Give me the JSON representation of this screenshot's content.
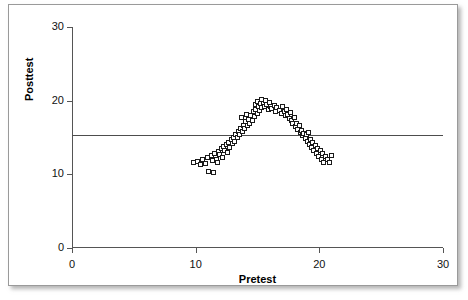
{
  "chart_data": {
    "type": "scatter",
    "title": "",
    "xlabel": "Pretest",
    "ylabel": "Posttest",
    "xlim": [
      0,
      30
    ],
    "ylim": [
      0,
      30
    ],
    "xticks": [
      0,
      10,
      20,
      30
    ],
    "yticks": [
      0,
      10,
      20,
      30
    ],
    "xtick_labels": [
      "0",
      "10",
      "20",
      "30"
    ],
    "ytick_labels": [
      "0",
      "10",
      "20",
      "30"
    ],
    "grid": false,
    "legend": null,
    "marker": "open-square",
    "marker_color": "#1a1a1a",
    "line_color": "#4d4d4d",
    "annotation": "Curvilinear (inverted-U) relation with a flat least-squares regression line at Posttest 15.3, illustrating near-zero linear correlation.",
    "regression_line": {
      "type": "linear-fit",
      "slope": 0.0,
      "intercept": 15.3,
      "x_start": 0,
      "x_end": 30,
      "y_start": 15.3,
      "y_end": 15.3
    },
    "n_points": 106,
    "x": [
      9.9,
      10.2,
      10.4,
      10.6,
      10.8,
      11.0,
      11.1,
      11.3,
      11.4,
      11.5,
      11.6,
      11.7,
      11.8,
      11.9,
      12.0,
      12.1,
      12.2,
      12.3,
      12.4,
      12.5,
      12.6,
      12.7,
      12.8,
      12.9,
      13.0,
      13.1,
      13.2,
      13.3,
      13.4,
      13.5,
      13.6,
      13.7,
      13.75,
      13.8,
      13.9,
      14.0,
      14.1,
      14.15,
      14.2,
      14.3,
      14.4,
      14.5,
      14.6,
      14.7,
      14.8,
      14.85,
      14.9,
      15.0,
      15.05,
      15.1,
      15.2,
      15.3,
      15.35,
      15.4,
      15.5,
      15.6,
      15.7,
      15.8,
      15.9,
      16.0,
      16.1,
      16.2,
      16.4,
      16.5,
      16.6,
      16.8,
      17.0,
      17.1,
      17.2,
      17.3,
      17.4,
      17.5,
      17.6,
      17.7,
      17.8,
      17.9,
      18.0,
      18.1,
      18.2,
      18.3,
      18.4,
      18.5,
      18.6,
      18.7,
      18.8,
      18.9,
      19.0,
      19.1,
      19.2,
      19.25,
      19.3,
      19.4,
      19.5,
      19.6,
      19.7,
      19.8,
      19.9,
      20.0,
      20.1,
      20.2,
      20.3,
      20.4,
      20.5,
      20.7,
      20.9,
      21.0
    ],
    "y": [
      11.6,
      11.7,
      11.2,
      11.9,
      11.4,
      12.2,
      10.3,
      12.5,
      11.8,
      10.2,
      12.8,
      12.0,
      11.5,
      13.0,
      12.6,
      13.4,
      12.2,
      13.7,
      13.1,
      14.0,
      12.9,
      14.3,
      13.6,
      14.6,
      14.1,
      15.0,
      14.4,
      15.4,
      14.9,
      15.8,
      15.3,
      16.2,
      17.6,
      15.7,
      16.6,
      16.1,
      17.1,
      18.0,
      16.5,
      17.4,
      16.9,
      17.9,
      17.3,
      18.4,
      17.8,
      19.4,
      18.8,
      18.2,
      19.8,
      19.1,
      18.6,
      19.5,
      20.1,
      19.0,
      19.6,
      19.2,
      20.0,
      19.4,
      18.8,
      19.7,
      19.2,
      18.9,
      19.3,
      18.5,
      19.0,
      18.6,
      18.2,
      19.1,
      18.4,
      17.9,
      18.7,
      18.0,
      17.5,
      18.3,
      17.2,
      16.8,
      17.6,
      16.4,
      16.9,
      16.0,
      16.5,
      15.6,
      15.9,
      15.2,
      15.5,
      14.8,
      15.3,
      14.4,
      15.6,
      14.0,
      14.7,
      13.6,
      14.2,
      13.2,
      13.9,
      12.8,
      13.5,
      12.4,
      13.1,
      11.9,
      12.7,
      11.5,
      12.3,
      12.0,
      11.6,
      12.5
    ]
  },
  "axes": {
    "y_title": "Posttest",
    "x_title": "Pretest"
  }
}
